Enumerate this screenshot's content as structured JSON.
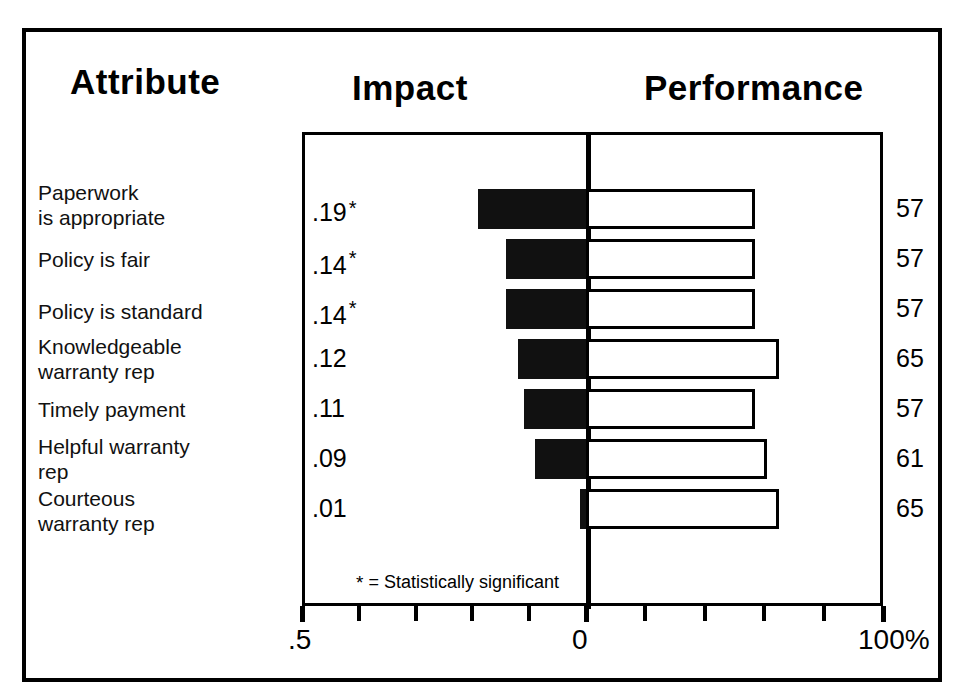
{
  "headers": {
    "attribute": "Attribute",
    "impact": "Impact",
    "performance": "Performance"
  },
  "footnote": {
    "symbol": "*",
    "text": "= Statistically significant"
  },
  "axis": {
    "left_label": ".5",
    "center_label": "0",
    "right_label": "100%"
  },
  "rows": [
    {
      "attribute_line1": "Paperwork",
      "attribute_line2": "is appropriate",
      "impact": ".19",
      "significant": true,
      "star": "*",
      "performance": "57"
    },
    {
      "attribute_line1": "Policy is fair",
      "attribute_line2": "",
      "impact": ".14",
      "significant": true,
      "star": "*",
      "performance": "57"
    },
    {
      "attribute_line1": "Policy is standard",
      "attribute_line2": "",
      "impact": ".14",
      "significant": true,
      "star": "*",
      "performance": "57"
    },
    {
      "attribute_line1": "Knowledgeable",
      "attribute_line2": "warranty rep",
      "impact": ".12",
      "significant": false,
      "star": "",
      "performance": "65"
    },
    {
      "attribute_line1": "Timely payment",
      "attribute_line2": "",
      "impact": ".11",
      "significant": false,
      "star": "",
      "performance": "57"
    },
    {
      "attribute_line1": "Helpful warranty",
      "attribute_line2": "rep",
      "impact": ".09",
      "significant": false,
      "star": "",
      "performance": "61"
    },
    {
      "attribute_line1": "Courteous",
      "attribute_line2": "warranty rep",
      "impact": ".01",
      "significant": false,
      "star": "",
      "performance": "65"
    }
  ],
  "chart_data": {
    "type": "bar",
    "title": "",
    "orientation": "horizontal",
    "layout": "diverging-tornado",
    "categories": [
      "Paperwork is appropriate",
      "Policy is fair",
      "Policy is standard",
      "Knowledgeable warranty rep",
      "Timely payment",
      "Helpful warranty rep",
      "Courteous warranty rep"
    ],
    "series": [
      {
        "name": "Impact",
        "direction": "left",
        "color": "#111111",
        "values": [
          0.19,
          0.14,
          0.14,
          0.12,
          0.11,
          0.09,
          0.01
        ],
        "value_labels": [
          ".19",
          ".14",
          ".14",
          ".12",
          ".11",
          ".09",
          ".01"
        ],
        "significant": [
          true,
          true,
          true,
          false,
          false,
          false,
          false
        ],
        "axis_range": [
          0.5,
          0
        ],
        "axis_tick_labels": [
          ".5",
          "0"
        ]
      },
      {
        "name": "Performance",
        "direction": "right",
        "color": "#ffffff",
        "border_color": "#000000",
        "values": [
          57,
          57,
          57,
          65,
          57,
          61,
          65
        ],
        "value_labels": [
          "57",
          "57",
          "57",
          "65",
          "57",
          "61",
          "65"
        ],
        "axis_range": [
          0,
          100
        ],
        "axis_tick_labels": [
          "0",
          "100%"
        ]
      }
    ],
    "xlabel": "",
    "ylabel": "",
    "grid": false,
    "legend": "none",
    "annotations": [
      "* = Statistically significant"
    ]
  }
}
